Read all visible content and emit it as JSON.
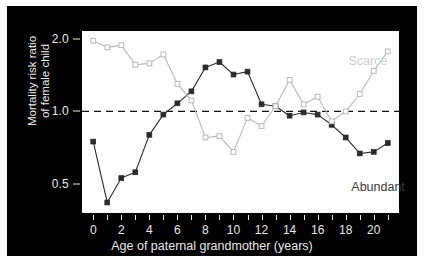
{
  "chart_data": {
    "type": "line",
    "title": "",
    "subtitle": "",
    "xlabel": "Age of paternal grandmother (years)",
    "ylabel": "Mortality risk ratio\nof female child",
    "ylabel_line1": "Mortality risk ratio",
    "ylabel_line2": "of female child",
    "yscale": "log",
    "ylim": [
      0.38,
      2.15
    ],
    "xlim": [
      -0.8,
      21.8
    ],
    "grid": false,
    "legend_position": "inline-annotations",
    "reference_line": {
      "value": 1.0,
      "style": "dashed",
      "color": "#111111"
    },
    "ytick_values": [
      2.0,
      1.0,
      0.5
    ],
    "ytick_labels": [
      "2.0",
      "1.0",
      "0.5"
    ],
    "xtick_values": [
      0,
      1,
      2,
      3,
      4,
      5,
      6,
      7,
      8,
      9,
      10,
      11,
      12,
      13,
      14,
      15,
      16,
      17,
      18,
      19,
      20,
      21
    ],
    "xtick_labels": [
      "0",
      "",
      "2",
      "",
      "4",
      "",
      "6",
      "",
      "8",
      "",
      "10",
      "",
      "12",
      "",
      "14",
      "",
      "16",
      "",
      "18",
      "",
      "20",
      ""
    ],
    "x": [
      0,
      1,
      2,
      3,
      4,
      5,
      6,
      7,
      8,
      9,
      10,
      11,
      12,
      13,
      14,
      15,
      16,
      17,
      18,
      19,
      20,
      21
    ],
    "series": [
      {
        "name": "Abundant",
        "marker": "filled-square",
        "color": "#2b2b2b",
        "label_color": "#3a3a3a",
        "values": [
          0.75,
          0.42,
          0.53,
          0.56,
          0.8,
          0.97,
          1.08,
          1.21,
          1.52,
          1.6,
          1.42,
          1.46,
          1.07,
          1.05,
          0.96,
          0.99,
          0.97,
          0.88,
          0.78,
          0.67,
          0.68,
          0.74
        ]
      },
      {
        "name": "Scarce",
        "marker": "open-square",
        "color": "#b9b9b9",
        "label_color": "#cfcfcf",
        "values": [
          1.96,
          1.84,
          1.88,
          1.56,
          1.58,
          1.72,
          1.3,
          1.11,
          0.78,
          0.79,
          0.68,
          0.94,
          0.87,
          1.05,
          1.35,
          1.07,
          1.15,
          0.91,
          1.0,
          1.18,
          1.47,
          1.77
        ]
      }
    ],
    "annotations": [
      {
        "text": "Scarce",
        "x": 18.2,
        "y": 1.72
      },
      {
        "text": "Abundant",
        "x": 18.4,
        "y": 0.52
      }
    ]
  },
  "figure": {
    "page_background": "#ffffff",
    "panel_background": "#000000",
    "plot_background": "#ffffff",
    "axis_text_color": "#e8e8e8"
  }
}
